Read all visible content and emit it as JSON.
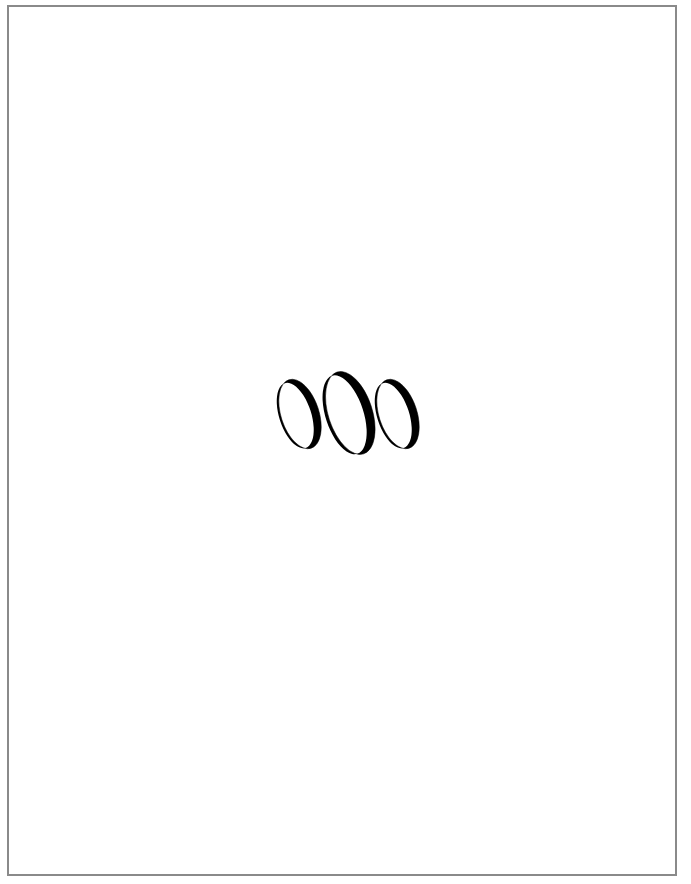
{
  "page": {
    "background": "#ffffff",
    "border_color": "#8a8a8a"
  },
  "graphic": {
    "description": "Three calligraphic crescent ellipses",
    "icon": "three-crescent-rings-icon",
    "stroke_color": "#000000",
    "count": 3
  }
}
